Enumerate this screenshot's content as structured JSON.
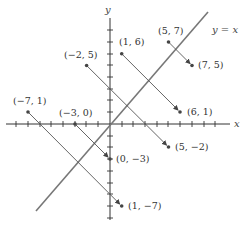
{
  "diagram": {
    "axes": {
      "x_label": "x",
      "y_label": "y",
      "x_range": [
        -9,
        10
      ],
      "y_range": [
        -8,
        9
      ]
    },
    "line_label": "y = x",
    "colors": {
      "axis": "#333333",
      "line": "#777777",
      "segment": "#555555",
      "point": "#444444"
    },
    "pairs": [
      {
        "from": {
          "label": "(5, 7)",
          "x": 5,
          "y": 7
        },
        "to": {
          "label": "(7, 5)",
          "x": 7,
          "y": 5
        }
      },
      {
        "from": {
          "label": "(1, 6)",
          "x": 1,
          "y": 6
        },
        "to": {
          "label": "(6, 1)",
          "x": 6,
          "y": 1
        }
      },
      {
        "from": {
          "label": "(−2, 5)",
          "x": -2,
          "y": 5
        },
        "to": {
          "label": "(5, −2)",
          "x": 5,
          "y": -2
        }
      },
      {
        "from": {
          "label": "(−7, 1)",
          "x": -7,
          "y": 1
        },
        "to": {
          "label": "(1, −7)",
          "x": 1,
          "y": -7
        }
      },
      {
        "from": {
          "label": "(−3, 0)",
          "x": -3,
          "y": 0
        },
        "to": {
          "label": "(0, −3)",
          "x": 0,
          "y": -3
        }
      }
    ]
  }
}
